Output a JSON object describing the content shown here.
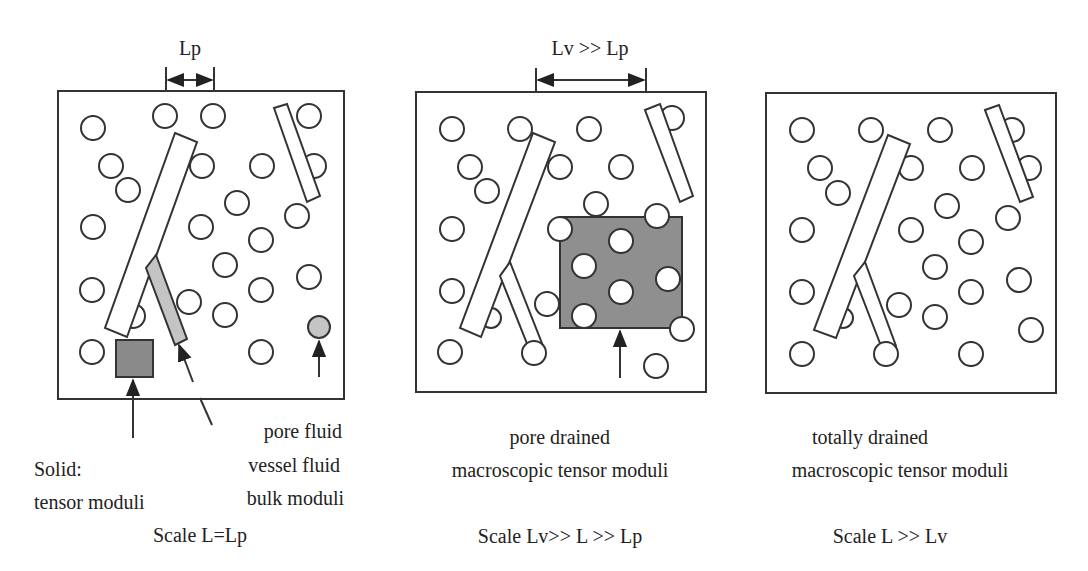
{
  "panels": [
    {
      "id": "pore-scale",
      "dimension_label": "Lp",
      "labels": {
        "solid_line1": "Solid:",
        "solid_line2": "tensor moduli",
        "fluid_line1": "pore fluid",
        "fluid_line2": "vessel fluid",
        "fluid_line3": "bulk moduli"
      },
      "scale_caption": "Scale L=Lp"
    },
    {
      "id": "vessel-scale",
      "dimension_label": "Lv >> Lp",
      "labels": {
        "line1": "pore drained",
        "line2": "macroscopic tensor moduli"
      },
      "scale_caption": "Scale Lv>> L >> Lp"
    },
    {
      "id": "macro-scale",
      "labels": {
        "line1": "totally drained",
        "line2": "macroscopic tensor moduli"
      },
      "scale_caption": "Scale L >> Lv"
    }
  ],
  "colors": {
    "outline": "#333333",
    "solid_fill": "#8a8a8a",
    "fluid_fill": "#c4c4c4",
    "rve_fill": "#8f8f8f"
  }
}
